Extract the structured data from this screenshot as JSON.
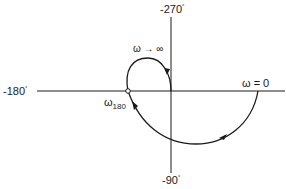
{
  "diagram": {
    "type": "polar-nyquist-plot",
    "axes": {
      "top_label": "-270",
      "bottom_label": "-90",
      "left_label": "-180",
      "degree_symbol": "°"
    },
    "annotations": {
      "omega_zero": "ω = 0",
      "omega_infinity": "ω → ∞",
      "omega_180_symbol": "ω",
      "omega_180_subscript": "180"
    },
    "colors": {
      "line": "#1a1a1a",
      "background": "#ffffff"
    }
  }
}
